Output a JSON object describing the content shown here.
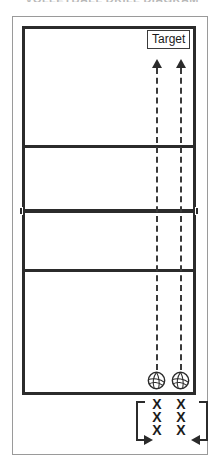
{
  "diagram": {
    "title_sliver": "VOLLEYBALL DRILL DIAGRAM",
    "court": {
      "name": "volleyball-court",
      "lines": [
        {
          "id": "attack-line-top",
          "label": "attack line"
        },
        {
          "id": "net",
          "label": "net"
        },
        {
          "id": "attack-line-bottom",
          "label": "attack line"
        }
      ]
    },
    "target": {
      "label": "Target"
    },
    "trajectories": [
      {
        "id": "trajectory-left",
        "style": "dashed",
        "direction": "up"
      },
      {
        "id": "trajectory-right",
        "style": "dashed",
        "direction": "up"
      }
    ],
    "balls": [
      {
        "id": "volleyball-left",
        "icon": "volleyball-icon"
      },
      {
        "id": "volleyball-right",
        "icon": "volleyball-icon"
      }
    ],
    "formation": {
      "label": "player queues",
      "columns": [
        {
          "id": "queue-left",
          "marks": [
            "X",
            "X",
            "X"
          ]
        },
        {
          "id": "queue-right",
          "marks": [
            "X",
            "X",
            "X"
          ]
        }
      ],
      "arrows": [
        {
          "id": "rotation-arrow-left",
          "direction": "right"
        },
        {
          "id": "rotation-arrow-right",
          "direction": "left"
        }
      ]
    },
    "colors": {
      "ink": "#2b2b2b",
      "frame": "#9a9a9a",
      "background": "#ffffff"
    }
  }
}
